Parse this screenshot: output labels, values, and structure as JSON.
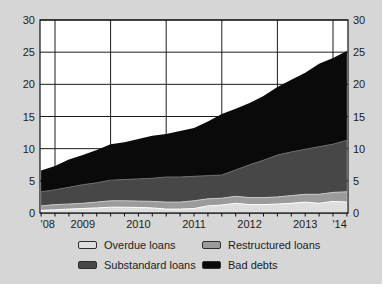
{
  "chart_data": {
    "type": "area",
    "stacked": true,
    "title": "",
    "xlabel": "",
    "ylabel": "",
    "x": [
      2008.75,
      2009.0,
      2009.25,
      2009.5,
      2009.75,
      2010.0,
      2010.25,
      2010.5,
      2010.75,
      2011.0,
      2011.25,
      2011.5,
      2011.75,
      2012.0,
      2012.25,
      2012.5,
      2012.75,
      2013.0,
      2013.25,
      2013.5,
      2013.75,
      2014.0,
      2014.25
    ],
    "series": [
      {
        "name": "Overdue loans",
        "color": "#dedede",
        "values": [
          0.4,
          0.5,
          0.6,
          0.7,
          0.8,
          0.9,
          0.9,
          0.85,
          0.8,
          0.6,
          0.6,
          0.7,
          1.1,
          1.25,
          1.5,
          1.3,
          1.3,
          1.4,
          1.5,
          1.7,
          1.5,
          1.8,
          1.7
        ]
      },
      {
        "name": "Restructured loans",
        "color": "#9b9b9b",
        "values": [
          0.7,
          0.8,
          0.8,
          0.8,
          0.9,
          1.0,
          1.0,
          1.0,
          1.0,
          1.1,
          1.1,
          1.2,
          1.1,
          1.05,
          1.1,
          1.1,
          1.1,
          1.1,
          1.2,
          1.2,
          1.4,
          1.4,
          1.6
        ]
      },
      {
        "name": "Substandard loans",
        "color": "#474747",
        "values": [
          2.2,
          2.3,
          2.6,
          2.9,
          3.0,
          3.2,
          3.3,
          3.45,
          3.6,
          3.9,
          3.9,
          3.8,
          3.6,
          3.6,
          4.1,
          5.1,
          5.8,
          6.5,
          6.8,
          7.0,
          7.4,
          7.5,
          8.0
        ]
      },
      {
        "name": "Bad debts",
        "color": "#0a0a0a",
        "values": [
          3.3,
          3.7,
          4.3,
          4.6,
          5.1,
          5.6,
          5.8,
          6.2,
          6.6,
          6.7,
          7.15,
          7.5,
          8.4,
          9.5,
          9.5,
          9.6,
          10.0,
          10.6,
          11.2,
          11.9,
          12.9,
          13.4,
          13.9
        ]
      }
    ],
    "x_range": [
      2008.73,
      2014.27
    ],
    "y_range": [
      0,
      30
    ],
    "y_ticks": [
      0,
      5,
      10,
      15,
      20,
      25,
      30
    ],
    "y_axis_sides": [
      "left",
      "right"
    ],
    "x_gridlines": [
      2009,
      2010,
      2011,
      2012,
      2013,
      2014
    ],
    "x_minor_tick_step": 0.25,
    "x_labels": [
      {
        "pos": 2008.87,
        "label": "'08"
      },
      {
        "pos": 2009.5,
        "label": "2009"
      },
      {
        "pos": 2010.5,
        "label": "2010"
      },
      {
        "pos": 2011.5,
        "label": "2011"
      },
      {
        "pos": 2012.5,
        "label": "2012"
      },
      {
        "pos": 2013.5,
        "label": "2013"
      },
      {
        "pos": 2014.12,
        "label": "'14"
      }
    ],
    "grid": true,
    "legend_position": "bottom",
    "boundary_line_colors": [
      "#ffffff",
      "#c9c9c9",
      "#6a6a6a"
    ]
  },
  "colors": {
    "panel_background": "#d6d6d6",
    "plot_background": "#ffffff",
    "grid": "#1c1c1c",
    "axis": "#111111",
    "text": "#1c1c1c",
    "legend_swatch_border": "#2e2e2e"
  }
}
